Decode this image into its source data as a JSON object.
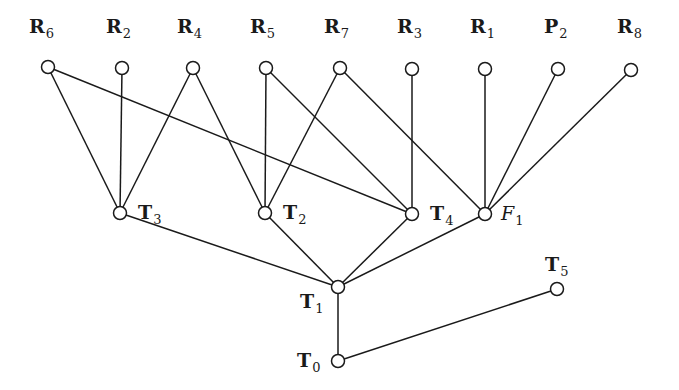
{
  "diagram": {
    "title": "",
    "nodes": [
      {
        "id": "R6",
        "label": "R",
        "sub": "6",
        "x": 48,
        "y": 67,
        "lx": 29,
        "ly": 33,
        "style": "bold"
      },
      {
        "id": "R2",
        "label": "R",
        "sub": "2",
        "x": 122,
        "y": 68,
        "lx": 106,
        "ly": 33,
        "style": "bold"
      },
      {
        "id": "R4",
        "label": "R",
        "sub": "4",
        "x": 193,
        "y": 68,
        "lx": 177,
        "ly": 33,
        "style": "bold"
      },
      {
        "id": "R5",
        "label": "R",
        "sub": "5",
        "x": 266,
        "y": 68,
        "lx": 250,
        "ly": 33,
        "style": "bold"
      },
      {
        "id": "R7",
        "label": "R",
        "sub": "7",
        "x": 340,
        "y": 68,
        "lx": 324,
        "ly": 33,
        "style": "bold"
      },
      {
        "id": "R3",
        "label": "R",
        "sub": "3",
        "x": 412,
        "y": 69,
        "lx": 397,
        "ly": 33,
        "style": "bold"
      },
      {
        "id": "R1",
        "label": "R",
        "sub": "1",
        "x": 485,
        "y": 69,
        "lx": 470,
        "ly": 33,
        "style": "bold"
      },
      {
        "id": "P2",
        "label": "P",
        "sub": "2",
        "x": 558,
        "y": 69,
        "lx": 544,
        "ly": 33,
        "style": "bold"
      },
      {
        "id": "R8",
        "label": "R",
        "sub": "8",
        "x": 631,
        "y": 70,
        "lx": 617,
        "ly": 33,
        "style": "bold"
      },
      {
        "id": "T3",
        "label": "T",
        "sub": "3",
        "x": 120,
        "y": 213,
        "lx": 138,
        "ly": 219,
        "style": "bold"
      },
      {
        "id": "T2",
        "label": "T",
        "sub": "2",
        "x": 265,
        "y": 213,
        "lx": 283,
        "ly": 219,
        "style": "bold"
      },
      {
        "id": "T4",
        "label": "T",
        "sub": "4",
        "x": 412,
        "y": 214,
        "lx": 430,
        "ly": 220,
        "style": "bold"
      },
      {
        "id": "F1",
        "label": "F",
        "sub": "1",
        "x": 485,
        "y": 214,
        "lx": 501,
        "ly": 220,
        "style": "script"
      },
      {
        "id": "T1",
        "label": "T",
        "sub": "1",
        "x": 338,
        "y": 287,
        "lx": 300,
        "ly": 308,
        "style": "bold"
      },
      {
        "id": "T5",
        "label": "T",
        "sub": "5",
        "x": 557,
        "y": 289,
        "lx": 545,
        "ly": 271,
        "style": "bold"
      },
      {
        "id": "T0",
        "label": "T",
        "sub": "0",
        "x": 338,
        "y": 361,
        "lx": 297,
        "ly": 367,
        "style": "bold"
      }
    ],
    "edges": [
      [
        "R6",
        "T3"
      ],
      [
        "R6",
        "T4"
      ],
      [
        "R2",
        "T3"
      ],
      [
        "R4",
        "T3"
      ],
      [
        "R4",
        "T2"
      ],
      [
        "R5",
        "T2"
      ],
      [
        "R5",
        "T4"
      ],
      [
        "R7",
        "T2"
      ],
      [
        "R7",
        "F1"
      ],
      [
        "R3",
        "T4"
      ],
      [
        "R1",
        "F1"
      ],
      [
        "P2",
        "F1"
      ],
      [
        "R8",
        "F1"
      ],
      [
        "T3",
        "T1"
      ],
      [
        "T2",
        "T1"
      ],
      [
        "T4",
        "T1"
      ],
      [
        "F1",
        "T1"
      ],
      [
        "T1",
        "T0"
      ],
      [
        "T0",
        "T5"
      ]
    ],
    "colors": {
      "stroke": "#1a1a1a",
      "node_fill": "#ffffff",
      "background": "#ffffff"
    },
    "node_radius": 6.5
  }
}
